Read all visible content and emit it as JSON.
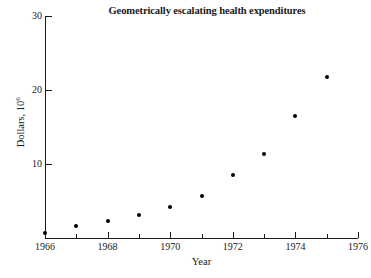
{
  "chart_data": {
    "type": "scatter",
    "title": "Geometrically escalating health expenditures",
    "xlabel": "Year",
    "ylabel": "Dollars, 10",
    "ylabel_exponent": "6",
    "x": [
      1966,
      1967,
      1968,
      1969,
      1970,
      1971,
      1972,
      1973,
      1974,
      1975
    ],
    "values": [
      0.7,
      1.6,
      2.3,
      3.1,
      4.2,
      5.7,
      8.5,
      11.3,
      16.5,
      21.7
    ],
    "series": [
      {
        "name": "Health expenditures",
        "values": [
          0.7,
          1.6,
          2.3,
          3.1,
          4.2,
          5.7,
          8.5,
          11.3,
          16.5,
          21.7
        ]
      }
    ],
    "xlim": [
      1966,
      1976
    ],
    "ylim": [
      0,
      30
    ],
    "xticks": [
      1966,
      1968,
      1970,
      1972,
      1974,
      1976
    ],
    "xticklabels": [
      "1966",
      "1968",
      "1970",
      "1972",
      "1974",
      "1976"
    ],
    "xticks_minor": [
      1967,
      1969,
      1971,
      1973,
      1975
    ],
    "yticks": [
      10,
      20,
      30
    ],
    "yticklabels": [
      "10",
      "20",
      "30"
    ],
    "grid": false,
    "legend": "none",
    "marker": "filled-circle",
    "marker_color": "#000000",
    "axis_color": "#1a1a1a",
    "background_color": "#ffffff"
  }
}
